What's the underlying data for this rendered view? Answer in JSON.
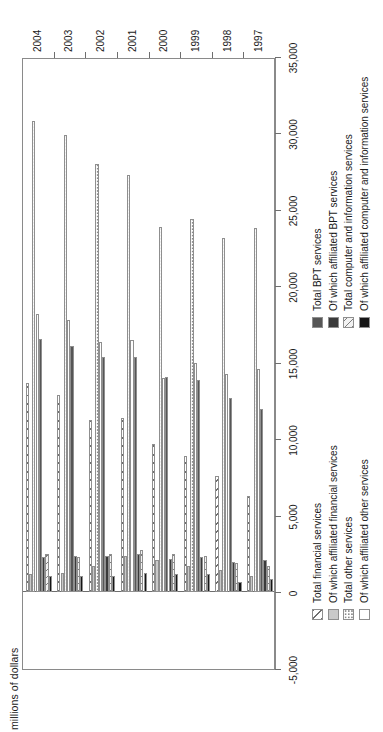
{
  "chart_data": {
    "type": "bar",
    "orientation": "horizontal-grouped",
    "title": "",
    "xlabel": "millions of dollars",
    "ylabel": "",
    "categories": [
      "1997",
      "1998",
      "1999",
      "2000",
      "2001",
      "2002",
      "2003",
      "2004"
    ],
    "ylim": [
      -5000,
      35000
    ],
    "yticks": [
      "-5,000",
      "0",
      "5,000",
      "10,000",
      "15,000",
      "20,000",
      "25,000",
      "30,000",
      "35,000"
    ],
    "ytick_values": [
      -5000,
      0,
      5000,
      10000,
      15000,
      20000,
      25000,
      30000,
      35000
    ],
    "grid": false,
    "legend_position": "below-axis",
    "series": [
      {
        "name": "Total financial services",
        "key": "fin",
        "pattern": "diagonal-hatch",
        "values": [
          6300,
          7600,
          8900,
          9700,
          11400,
          11300,
          12900,
          13700
        ]
      },
      {
        "name": "Of which affiliated financial services",
        "key": "finaff",
        "pattern": "solid-gray",
        "values": [
          1100,
          1500,
          1700,
          2100,
          2400,
          1700,
          1300,
          1200
        ]
      },
      {
        "name": "Total other services",
        "key": "oth",
        "pattern": "stipple",
        "values": [
          23800,
          23200,
          24400,
          23900,
          27300,
          28000,
          29900,
          30800
        ]
      },
      {
        "name": "Of which affiliated other services",
        "key": "othaff",
        "pattern": "white",
        "values": [
          14600,
          14300,
          15000,
          14000,
          16500,
          16400,
          17800,
          18200
        ]
      },
      {
        "name": "Total BPT services",
        "key": "bpt",
        "pattern": "dark-gray",
        "values": [
          12000,
          12700,
          13900,
          14100,
          15400,
          15400,
          16100,
          16600
        ]
      },
      {
        "name": "Of which affiliated BPT services",
        "key": "bptaff",
        "pattern": "darker-gray",
        "values": [
          2100,
          2000,
          2300,
          2200,
          2500,
          2400,
          2400,
          2300
        ]
      },
      {
        "name": "Total computer and information services",
        "key": "cis",
        "pattern": "light-hatch",
        "values": [
          1700,
          1900,
          2400,
          2500,
          2800,
          2500,
          2300,
          2500
        ]
      },
      {
        "name": "Of which affiliated computer and information services",
        "key": "cisaff",
        "pattern": "black",
        "values": [
          900,
          700,
          1200,
          1200,
          1300,
          1100,
          1100,
          1100
        ]
      }
    ]
  },
  "axis": {
    "value_axis_label": "millions of dollars"
  },
  "legend_left": {
    "items": [
      {
        "label": "Total financial services",
        "key": "fin"
      },
      {
        "label": "Of which affiliated financial services",
        "key": "finaff"
      },
      {
        "label": "Total other services",
        "key": "oth"
      },
      {
        "label": "Of which affiliated other services",
        "key": "othaff"
      }
    ]
  },
  "legend_right": {
    "items": [
      {
        "label": "Total BPT services",
        "key": "bpt"
      },
      {
        "label": "Of which affiliated BPT services",
        "key": "bptaff"
      },
      {
        "label": "Total computer and information services",
        "key": "cis"
      },
      {
        "label": "Of which affiliated computer and information services",
        "key": "cisaff"
      }
    ]
  },
  "colors": {
    "frame": "#8a8a8a",
    "zero_line": "#6e6e6e",
    "text": "#1a1a1a",
    "bpt": "#565656",
    "bpt_affiliated": "#3a3a3a",
    "financial_affiliated": "#c9c9c9",
    "cis_affiliated": "#151515"
  }
}
